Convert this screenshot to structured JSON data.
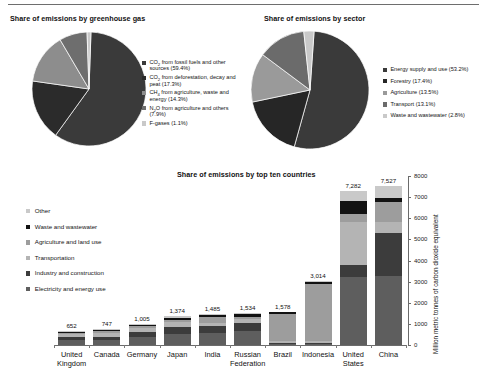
{
  "figure": {
    "pie_gas": {
      "title": "Share of emissions by greenhouse gas",
      "legend": [
        {
          "label": "CO2 from fossil fuels and other sources (59.4%)",
          "value": 59.4,
          "color": "#3a3a3a"
        },
        {
          "label": "CO2 from deforestation, decay and peat (17.3%)",
          "value": 17.3,
          "color": "#2b2b2b"
        },
        {
          "label": "CH4 from agriculture, waste and energy (14.3%)",
          "value": 14.3,
          "color": "#8d8d8d"
        },
        {
          "label": "N2O from agriculture and others (7.9%)",
          "value": 7.9,
          "color": "#6e6e6e"
        },
        {
          "label": "F-gases (1.1%)",
          "value": 1.1,
          "color": "#c9c9c9"
        }
      ]
    },
    "pie_sector": {
      "title": "Share of emissions by sector",
      "legend": [
        {
          "label": "Energy supply and use (53.2%)",
          "value": 53.2,
          "color": "#3a3a3a"
        },
        {
          "label": "Forestry (17.4%)",
          "value": 17.4,
          "color": "#262626"
        },
        {
          "label": "Agriculture (13.5%)",
          "value": 13.5,
          "color": "#9a9a9a"
        },
        {
          "label": "Transport (13.1%)",
          "value": 13.1,
          "color": "#6b6b6b"
        },
        {
          "label": "Waste and wastewater (2.8%)",
          "value": 2.8,
          "color": "#c9c9c9"
        }
      ]
    },
    "bar": {
      "title": "Share of emissions by top ten countries",
      "y_axis_title": "Million metric tonnes of carbon dioxide equivalent",
      "legend": [
        {
          "label": "Other",
          "color": "#c9c9c9"
        },
        {
          "label": "Waste and wastewater",
          "color": "#121212"
        },
        {
          "label": "Agriculture and land use",
          "color": "#9d9d9d"
        },
        {
          "label": "Transportation",
          "color": "#b4b4b4"
        },
        {
          "label": "Industry and construction",
          "color": "#3c3c3c"
        },
        {
          "label": "Electricity and energy use",
          "color": "#5e5e5e"
        }
      ]
    }
  },
  "chart_data": {
    "type": "bar",
    "title": "Share of emissions by top ten countries",
    "xlabel": "",
    "ylabel": "Million metric tonnes of carbon dioxide equivalent",
    "ylim": [
      0,
      8000
    ],
    "yticks": [
      0,
      1000,
      2000,
      3000,
      4000,
      5000,
      6000,
      7000,
      8000
    ],
    "grid": false,
    "legend_position": "left-inside",
    "stacked": true,
    "categories": [
      "United Kingdom",
      "Canada",
      "Germany",
      "Japan",
      "India",
      "Russian Federation",
      "Brazil",
      "Indonesia",
      "United States",
      "China"
    ],
    "totals": [
      652,
      747,
      1005,
      1374,
      1485,
      1534,
      1578,
      3014,
      7282,
      7527
    ],
    "total_labels": [
      "652",
      "747",
      "1,005",
      "1,374",
      "1,485",
      "1,534",
      "1,578",
      "3,014",
      "7,282",
      "7,527"
    ],
    "series": [
      {
        "name": "Electricity and energy use",
        "color": "#5e5e5e",
        "values": [
          230,
          240,
          380,
          500,
          560,
          640,
          60,
          70,
          3200,
          3250
        ]
      },
      {
        "name": "Industry and construction",
        "color": "#3c3c3c",
        "values": [
          150,
          150,
          230,
          330,
          330,
          420,
          40,
          40,
          600,
          2050
        ]
      },
      {
        "name": "Transportation",
        "color": "#b4b4b4",
        "values": [
          120,
          180,
          180,
          250,
          160,
          180,
          100,
          70,
          2000,
          520
        ]
      },
      {
        "name": "Agriculture and land use",
        "color": "#9d9d9d",
        "values": [
          60,
          90,
          100,
          110,
          300,
          110,
          1280,
          2700,
          400,
          960
        ]
      },
      {
        "name": "Waste and wastewater",
        "color": "#121212",
        "values": [
          50,
          40,
          50,
          80,
          90,
          110,
          80,
          120,
          600,
          200
        ]
      },
      {
        "name": "Other",
        "color": "#c9c9c9",
        "values": [
          42,
          47,
          65,
          104,
          45,
          74,
          18,
          14,
          482,
          547
        ]
      }
    ]
  }
}
